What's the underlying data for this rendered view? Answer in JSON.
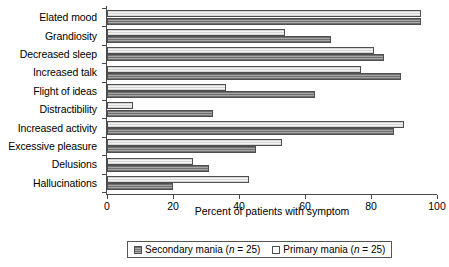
{
  "chart_data": {
    "type": "bar",
    "orientation": "horizontal",
    "title": "",
    "xlabel": "Percent of patients with symptom",
    "ylabel": "",
    "xlim": [
      0,
      100
    ],
    "xticks": [
      0,
      20,
      40,
      60,
      80,
      100
    ],
    "grid": false,
    "legend_position": "bottom",
    "categories": [
      "Elated mood",
      "Grandiosity",
      "Decreased sleep",
      "Increased talk",
      "Flight of ideas",
      "Distractibility",
      "Increased activity",
      "Excessive pleasure",
      "Delusions",
      "Hallucinations"
    ],
    "series": [
      {
        "name": "Primary mania (n = 25)",
        "short_name": "Primary mania",
        "n": 25,
        "color": "#f4f4f4",
        "values": [
          95,
          54,
          81,
          77,
          36,
          8,
          90,
          53,
          26,
          43
        ]
      },
      {
        "name": "Secondary mania (n = 25)",
        "short_name": "Secondary mania",
        "n": 25,
        "color": "#9b9b9b",
        "values": [
          95,
          68,
          84,
          89,
          63,
          32,
          87,
          45,
          31,
          20
        ]
      }
    ]
  },
  "legend": {
    "entries": [
      {
        "label_prefix": "Secondary mania (",
        "label_italic": "n",
        "label_suffix": " = 25)",
        "style": "secondary"
      },
      {
        "label_prefix": "Primary mania (",
        "label_italic": "n",
        "label_suffix": " = 25)",
        "style": "primary"
      }
    ]
  },
  "axis": {
    "x_title": "Percent of patients with symptom",
    "x_tick_labels": [
      "0",
      "20",
      "40",
      "60",
      "80",
      "100"
    ]
  }
}
